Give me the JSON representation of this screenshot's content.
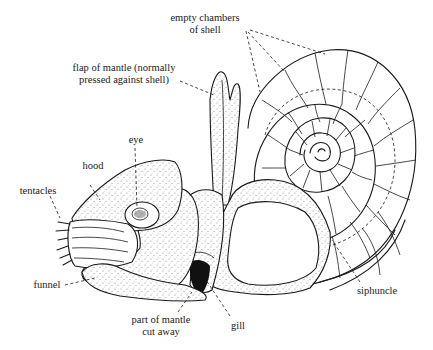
{
  "diagram": {
    "labels": {
      "empty_chambers_line1": "empty chambers",
      "empty_chambers_line2": "of shell",
      "flap_line1": "flap of mantle (normally",
      "flap_line2": "pressed against shell)",
      "eye": "eye",
      "hood": "hood",
      "tentacles": "tentacles",
      "funnel": "funnel",
      "part_mantle_line1": "part of mantle",
      "part_mantle_line2": "cut away",
      "gill": "gill",
      "siphuncle": "siphuncle"
    },
    "colors": {
      "ink": "#1a1a1a",
      "background": "#ffffff"
    }
  }
}
